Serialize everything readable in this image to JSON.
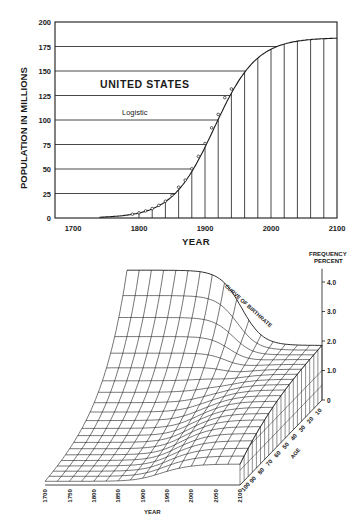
{
  "chart_data": [
    {
      "type": "line",
      "title": "UNITED STATES",
      "subtitle": "Logistic",
      "xlabel": "YEAR",
      "ylabel": "POPULATION IN MILLIONS",
      "xlim": [
        1672,
        2100
      ],
      "ylim": [
        0,
        200
      ],
      "x_ticks": [
        1700,
        1800,
        1900,
        2000,
        2100
      ],
      "y_ticks": [
        0,
        25,
        50,
        75,
        100,
        125,
        150,
        175,
        200
      ],
      "grid": "horizontal lines at each y tick; vertical drop lines every 20 years under the curve",
      "series": [
        {
          "name": "Logistic curve",
          "carrying_capacity": 184,
          "x": [
            1760,
            1780,
            1800,
            1820,
            1840,
            1860,
            1880,
            1900,
            1920,
            1940,
            1960,
            1980,
            2000,
            2020,
            2040,
            2060,
            2080,
            2100
          ],
          "values": [
            0.5,
            2.5,
            5.5,
            9.8,
            17.5,
            30.5,
            50.5,
            77,
            106,
            132,
            152,
            165,
            174,
            179,
            182,
            183,
            184,
            184
          ]
        },
        {
          "name": "Census points",
          "x": [
            1790,
            1800,
            1810,
            1820,
            1830,
            1840,
            1850,
            1860,
            1870,
            1880,
            1890,
            1900,
            1910,
            1920,
            1930,
            1940
          ],
          "values": [
            3.9,
            5.3,
            7.2,
            9.6,
            12.9,
            17.1,
            23.2,
            31.4,
            38.6,
            50.2,
            62.9,
            76.0,
            92.0,
            105.7,
            122.8,
            131.7
          ]
        }
      ]
    },
    {
      "type": "surface",
      "title": "",
      "annotation": "CURVE OF BIRTHRATE",
      "xlabel": "YEAR",
      "ylabel": "AGE",
      "zlabel": "FREQUENCY PERCENT",
      "x_ticks": [
        1700,
        1750,
        1800,
        1850,
        1900,
        1950,
        2000,
        2050,
        2100
      ],
      "y_ticks": [
        10,
        20,
        30,
        40,
        50,
        60,
        70,
        80,
        90,
        100
      ],
      "z_ticks": [
        "0",
        "1.0",
        "2.0",
        "3.0",
        "4.0"
      ],
      "zlim": [
        0,
        4.0
      ],
      "birthrate_curve": {
        "x": [
          1700,
          1750,
          1800,
          1850,
          1900,
          1950,
          2000,
          2050,
          2100
        ],
        "values": [
          4.2,
          4.2,
          4.2,
          4.1,
          3.7,
          2.9,
          2.1,
          1.8,
          1.8
        ]
      }
    }
  ]
}
